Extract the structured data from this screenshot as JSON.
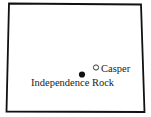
{
  "map": {
    "region": "Wyoming",
    "outline_color": "#111111",
    "markers": [
      {
        "name": "Casper",
        "symbol": "open-circle",
        "x": 96,
        "y": 68
      },
      {
        "name": "Independence Rock",
        "symbol": "filled-circle",
        "x": 82,
        "y": 74
      }
    ]
  },
  "labels": {
    "casper": "Casper",
    "independence_rock": "Independence Rock"
  }
}
